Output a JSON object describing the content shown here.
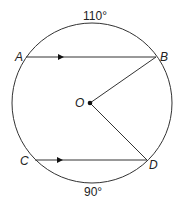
{
  "diagram": {
    "type": "circle-geometry",
    "points": {
      "A": "A",
      "B": "B",
      "C": "C",
      "D": "D",
      "O": "O"
    },
    "arcs": {
      "top_arc_AB": "110°",
      "bottom_arc_CD": "90°"
    },
    "segments": [
      "AB (parallel, arrow)",
      "CD (parallel, arrow)",
      "OB",
      "OD"
    ],
    "colors": {
      "stroke": "#333333",
      "background": "#ffffff"
    }
  }
}
